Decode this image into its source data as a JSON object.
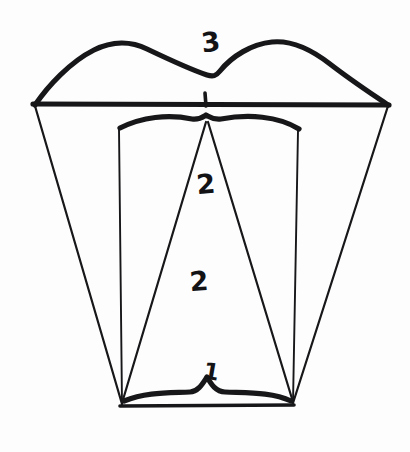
{
  "figure": {
    "title": "",
    "kind": "hand-drawn-line-diagram",
    "background_color": "#fdfdfd",
    "ink_color": "#17171a",
    "canvas": {
      "width": 410,
      "height": 452
    }
  },
  "labels": [
    {
      "id": "label-3",
      "text": "3",
      "x": 211,
      "y": 44
    },
    {
      "id": "label-2-upper",
      "text": "2",
      "x": 206,
      "y": 186
    },
    {
      "id": "label-2-lower",
      "text": "2",
      "x": 199,
      "y": 283
    },
    {
      "id": "label-1",
      "text": "1",
      "x": 211,
      "y": 373
    }
  ],
  "strokes": {
    "crown_outline": "M 35,105 C 48,86 70,62 94,50 C 112,41 131,41 147,49 C 168,59 192,70 207,75 C 213,77 216,76 220,71 C 232,56 252,44 272,42 C 292,40 312,50 330,64 C 352,81 372,94 388,105",
    "cervical_line": "M 33,104 L 389,105",
    "center_tick": "M 205,93 L 206,106",
    "pulp_roof_curve": "M 120,128 C 142,117 168,114 192,119 C 199,120 203,117 206,115 C 210,117 213,120 221,119 C 248,114 278,116 299,129",
    "root_left_outer": "M 35,106 L 122,404",
    "root_right_outer": "M 388,106 L 293,403",
    "canal_left_wall": "M 119,129 L 122,404",
    "canal_right_wall": "M 298,131 L 293,403",
    "pulp_triangle_left": "M 206,122 L 122,403",
    "pulp_triangle_right": "M 208,122 L 293,402",
    "apex_brace": "M 124,401 C 146,392 168,393 190,392 C 198,392 203,383 207,377 C 211,384 216,392 225,392 C 248,393 272,392 291,401",
    "apex_base_line": "M 120,406 L 294,405"
  }
}
